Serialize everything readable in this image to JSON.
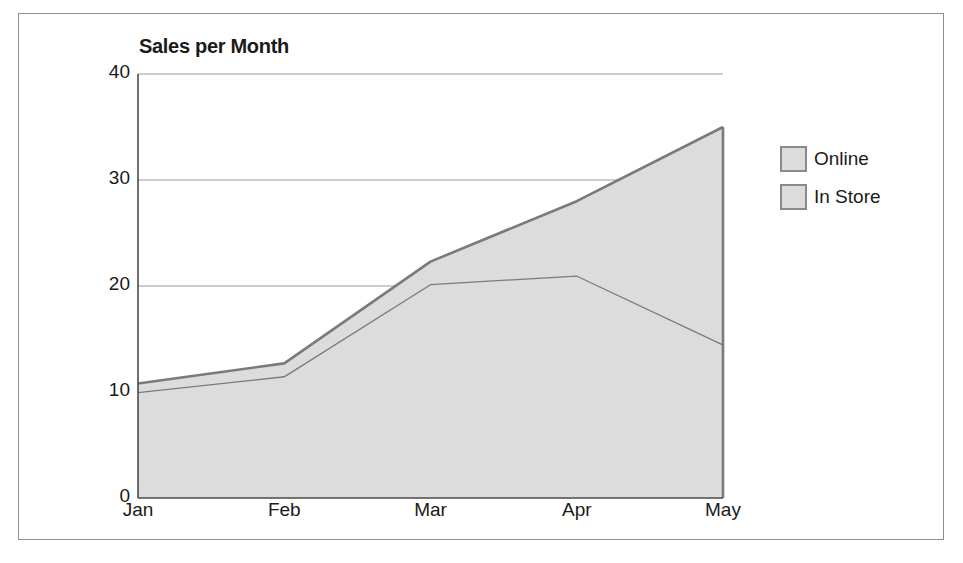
{
  "figure": {
    "border_color": "#8d8d8d",
    "background": "#ffffff"
  },
  "chart_data": {
    "type": "area",
    "stacked": true,
    "title": "Sales per Month",
    "xlabel": "",
    "ylabel": "",
    "categories": [
      "Jan",
      "Feb",
      "Mar",
      "Apr",
      "May"
    ],
    "series": [
      {
        "name": "Online",
        "values": [
          0.8,
          1.2,
          2.1,
          7.0,
          20.5
        ],
        "color": "#dcdcdc",
        "line_color": "#7a7a7a"
      },
      {
        "name": "In Store",
        "values": [
          10.0,
          11.5,
          20.2,
          21.0,
          14.5
        ],
        "color": "#dcdcdc",
        "line_color": "#7a7a7a"
      }
    ],
    "cumulative_top": [
      10.8,
      12.7,
      22.3,
      28.0,
      35.0
    ],
    "ylim": [
      0,
      40
    ],
    "yticks": [
      0,
      10,
      20,
      30,
      40
    ],
    "ytick_labels": [
      "0",
      "10",
      "20",
      "30",
      "40"
    ],
    "grid": true,
    "gridline_color": "#9a9a9a",
    "legend_position": "right"
  },
  "legend": {
    "items": [
      {
        "label": "Online"
      },
      {
        "label": "In Store"
      }
    ]
  }
}
